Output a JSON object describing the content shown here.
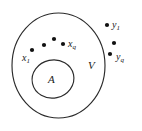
{
  "figure": {
    "name": "set-containment-diagram",
    "background_color": "#ffffff",
    "stroke_color": "#2b2b2b",
    "dot_color": "#111111",
    "text_color": "#1a1a1a",
    "width": 142,
    "height": 131
  },
  "regions": [
    {
      "id": "outer-region",
      "label": "V",
      "label_base": "V",
      "label_sub": "",
      "shape": "ellipse",
      "cx": 58.5,
      "cy": 65.5,
      "rx": 46.5,
      "ry": 52.5,
      "label_x": 88,
      "label_y": 69
    },
    {
      "id": "inner-region",
      "label": "A",
      "label_base": "A",
      "label_sub": "",
      "shape": "ellipse",
      "cx": 53,
      "cy": 79,
      "rx": 21,
      "ry": 19,
      "rotation": -12,
      "label_x": 48,
      "label_y": 83
    }
  ],
  "point_groups": [
    {
      "id": "x-points",
      "description": "points inside region V",
      "dots": [
        {
          "id": "x1-dot",
          "cx": 32,
          "cy": 50,
          "r": 2.1
        },
        {
          "id": "x-dot-2",
          "cx": 44,
          "cy": 45,
          "r": 2.1
        },
        {
          "id": "x-dot-3",
          "cx": 54,
          "cy": 39,
          "r": 2.1
        },
        {
          "id": "xq-dot",
          "cx": 63,
          "cy": 44,
          "r": 2.1
        }
      ],
      "labels": [
        {
          "id": "x1-label",
          "base": "x",
          "sub": "1",
          "x": 22,
          "y": 61
        },
        {
          "id": "xq-label",
          "base": "x",
          "sub": "q",
          "x": 68,
          "y": 47
        }
      ]
    },
    {
      "id": "y-points",
      "description": "points outside region V",
      "dots": [
        {
          "id": "y1-dot",
          "cx": 107,
          "cy": 25,
          "r": 2.1
        },
        {
          "id": "y-dot-2",
          "cx": 114,
          "cy": 43,
          "r": 2.1
        },
        {
          "id": "yq-dot",
          "cx": 110,
          "cy": 54,
          "r": 2.1
        }
      ],
      "labels": [
        {
          "id": "y1-label",
          "base": "y",
          "sub": "1",
          "x": 112,
          "y": 28
        },
        {
          "id": "yq-label",
          "base": "y",
          "sub": "q",
          "x": 116,
          "y": 60
        }
      ]
    }
  ],
  "labels_text": {
    "outer_region": "V",
    "inner_region": "A",
    "x_first_base": "x",
    "x_first_sub": "1",
    "x_last_base": "x",
    "x_last_sub": "q",
    "y_first_base": "y",
    "y_first_sub": "1",
    "y_last_base": "y",
    "y_last_sub": "q"
  }
}
